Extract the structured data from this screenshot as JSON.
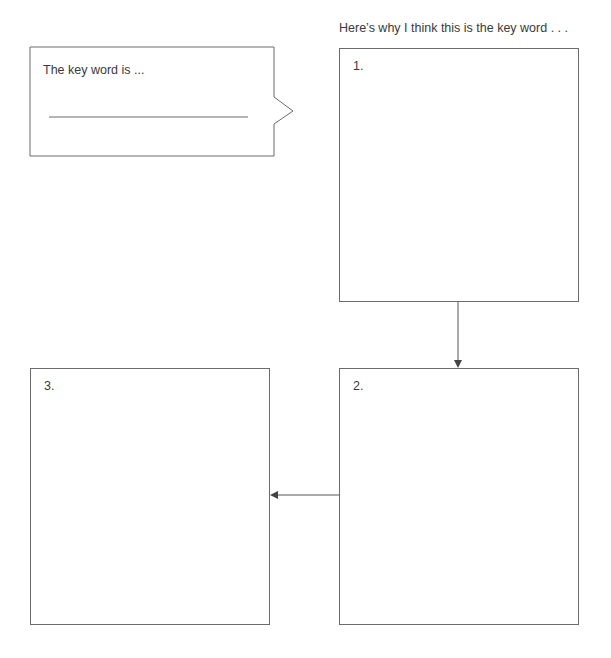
{
  "callout": {
    "prompt": "The key word is ...",
    "answer_line": ""
  },
  "reasons_heading": "Here’s why I think this is the key word . . .",
  "boxes": [
    {
      "number": "1."
    },
    {
      "number": "2."
    },
    {
      "number": "3."
    }
  ],
  "colors": {
    "stroke": "#6b6b6b",
    "text": "#3a3a3a",
    "background": "#ffffff"
  }
}
